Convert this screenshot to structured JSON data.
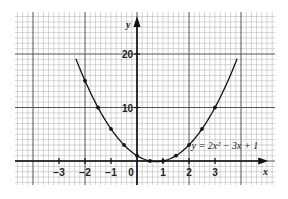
{
  "chart_data": {
    "type": "line",
    "title": "",
    "equation_label": "y = 2x² − 3x + 1",
    "xlabel": "x",
    "ylabel": "y",
    "xlim": [
      -4.7,
      5.3
    ],
    "ylim": [
      -4.5,
      28
    ],
    "x_ticks": [
      -3,
      -2,
      -1,
      0,
      1,
      2,
      3
    ],
    "x_tick_labels": [
      "−3",
      "−2",
      "−1",
      "0",
      "1",
      "2",
      "3"
    ],
    "y_ticks": [
      10,
      20
    ],
    "y_tick_labels": [
      "10",
      "20"
    ],
    "grid": true,
    "series": [
      {
        "name": "y = 2x² − 3x + 1",
        "x": [
          -2,
          -1.5,
          -1,
          -0.5,
          0,
          0.5,
          1,
          1.5,
          2,
          2.5,
          3
        ],
        "values": [
          15,
          10,
          6,
          3,
          1,
          0,
          0,
          1,
          3,
          6,
          10
        ],
        "curve_range": [
          -2.35,
          3.85
        ]
      }
    ]
  },
  "colors": {
    "grid_minor": "#b8b8b8",
    "grid_major": "#555555",
    "axis": "#111111",
    "curve": "#111111"
  }
}
